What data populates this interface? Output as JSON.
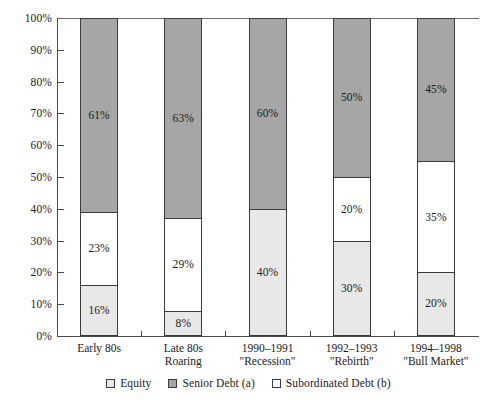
{
  "chart_data": {
    "type": "bar",
    "stacked": true,
    "normalized": "100%",
    "title": "",
    "subtitle": "",
    "xlabel": "",
    "ylabel": "",
    "ylim": [
      0,
      100
    ],
    "grid": false,
    "legend_position": "bottom-center",
    "categories": [
      "Early 80s",
      "Late 80s\nRoaring",
      "1990–1991\n\"Recession\"",
      "1992–1993\n\"Rebirth\"",
      "1994–1998\n\"Bull Market\""
    ],
    "category_lines": [
      [
        "Early 80s"
      ],
      [
        "Late 80s",
        "Roaring"
      ],
      [
        "1990–1991",
        "\"Recession\""
      ],
      [
        "1992–1993",
        "\"Rebirth\""
      ],
      [
        "1994–1998",
        "\"Bull Market\""
      ]
    ],
    "ytick_labels": [
      "0%",
      "10%",
      "20%",
      "30%",
      "40%",
      "50%",
      "60%",
      "70%",
      "80%",
      "90%",
      "100%"
    ],
    "ytick_values": [
      0,
      10,
      20,
      30,
      40,
      50,
      60,
      70,
      80,
      90,
      100
    ],
    "series": [
      {
        "name": "Equity",
        "key": "equity",
        "color": "#e8e8e8",
        "values": [
          16,
          8,
          40,
          30,
          20
        ],
        "labels": [
          "16%",
          "8%",
          "40%",
          "30%",
          "20%"
        ]
      },
      {
        "name": "Subordinated Debt (b)",
        "key": "subordinated",
        "color": "#ffffff",
        "values": [
          23,
          29,
          0,
          20,
          35
        ],
        "labels": [
          "23%",
          "29%",
          "",
          "20%",
          "35%"
        ]
      },
      {
        "name": "Senior Debt (a)",
        "key": "senior",
        "color": "#a6a6a6",
        "values": [
          61,
          63,
          60,
          50,
          45
        ],
        "labels": [
          "61%",
          "63%",
          "60%",
          "50%",
          "45%"
        ]
      }
    ],
    "legend": [
      {
        "label": "Equity",
        "key": "equity",
        "color": "#e8e8e8"
      },
      {
        "label": "Senior Debt (a)",
        "key": "senior",
        "color": "#a6a6a6"
      },
      {
        "label": "Subordinated Debt (b)",
        "key": "subordinated",
        "color": "#ffffff"
      }
    ],
    "colors": {
      "equity": "#e8e8e8",
      "senior": "#a6a6a6",
      "subordinated": "#ffffff",
      "axis": "#4a4a4a",
      "outline": "#3c3c3c",
      "text": "#1a1a1a",
      "background": "#ffffff"
    }
  }
}
